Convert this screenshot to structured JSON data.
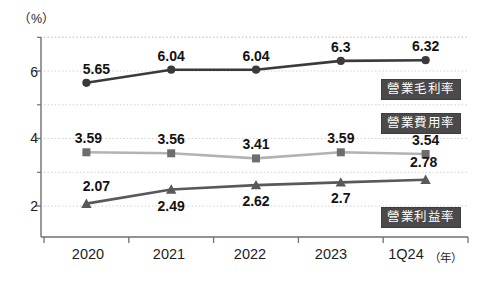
{
  "chart_data": {
    "type": "line",
    "title": "",
    "subtitle": "",
    "unit_label": "（%）",
    "xlabel": "（年）",
    "ylabel": "",
    "categories": [
      "2020",
      "2021",
      "2022",
      "2023",
      "1Q24"
    ],
    "ylim": [
      1.6,
      7.1
    ],
    "yticks_major": [
      "2",
      "4",
      "6"
    ],
    "yticks_major_values": [
      2,
      4,
      6
    ],
    "yticks_minor_values": [
      3,
      5,
      7
    ],
    "gridlines": [
      2,
      3,
      4,
      5,
      6,
      7
    ],
    "grid": true,
    "legend_position": "inside-right",
    "series": [
      {
        "name": "營業毛利率",
        "marker": "circle",
        "color": "#3a3a3a",
        "values": [
          5.65,
          6.04,
          6.04,
          6.3,
          6.32
        ],
        "labels": [
          "5.65",
          "6.04",
          "6.04",
          "6.3",
          "6.32"
        ]
      },
      {
        "name": "營業費用率",
        "marker": "square",
        "color": "#b3b3b3",
        "values": [
          3.59,
          3.56,
          3.41,
          3.59,
          3.54
        ],
        "labels": [
          "3.59",
          "3.56",
          "3.41",
          "3.59",
          "3.54"
        ]
      },
      {
        "name": "營業利益率",
        "marker": "triangle",
        "color": "#595959",
        "values": [
          2.07,
          2.49,
          2.62,
          2.7,
          2.78
        ],
        "labels": [
          "2.07",
          "2.49",
          "2.62",
          "2.7",
          "2.78"
        ]
      }
    ]
  },
  "axis": {
    "ytick_2": "2",
    "ytick_4": "4",
    "ytick_6": "6",
    "xtick_0": "2020",
    "xtick_1": "2021",
    "xtick_2": "2022",
    "xtick_3": "2023",
    "xtick_4": "1Q24",
    "x_unit": "（年）",
    "y_unit": "（%）"
  },
  "legend": {
    "gross_margin": "營業毛利率",
    "opex_ratio": "營業費用率",
    "operating_margin": "營業利益率"
  },
  "point_labels": {
    "s0": [
      "5.65",
      "6.04",
      "6.04",
      "6.3",
      "6.32"
    ],
    "s1": [
      "3.59",
      "3.56",
      "3.41",
      "3.59",
      "3.54"
    ],
    "s2": [
      "2.07",
      "2.49",
      "2.62",
      "2.7",
      "2.78"
    ]
  },
  "colors": {
    "gross_margin": "#3a3a3a",
    "opex_ratio": "#b3b3b3",
    "operating_margin": "#595959",
    "legend_bg": "#4a4a4a",
    "grid": "#cfcfcf",
    "axis": "#6f6f6f"
  }
}
